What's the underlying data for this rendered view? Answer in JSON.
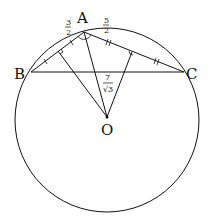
{
  "diagram": {
    "type": "geometry",
    "circle": {
      "center": "O",
      "cx": 107,
      "cy": 120,
      "r": 92
    },
    "points": {
      "A": {
        "label": "A",
        "x": 84,
        "y": 32
      },
      "B": {
        "label": "B",
        "x": 31,
        "y": 72
      },
      "C": {
        "label": "C",
        "x": 184,
        "y": 72
      },
      "O": {
        "label": "O",
        "x": 107,
        "y": 117
      }
    },
    "segments": [
      "AB",
      "AC",
      "BC",
      "AO",
      "O-footAB",
      "O-footAC"
    ],
    "labels": {
      "ab_half": {
        "num": "3",
        "den": "2"
      },
      "ac_half": {
        "num": "5",
        "den": "2"
      },
      "ao": {
        "num": "7",
        "den": "√3"
      }
    },
    "colors": {
      "stroke": "#111111",
      "background": "#ffffff"
    }
  }
}
